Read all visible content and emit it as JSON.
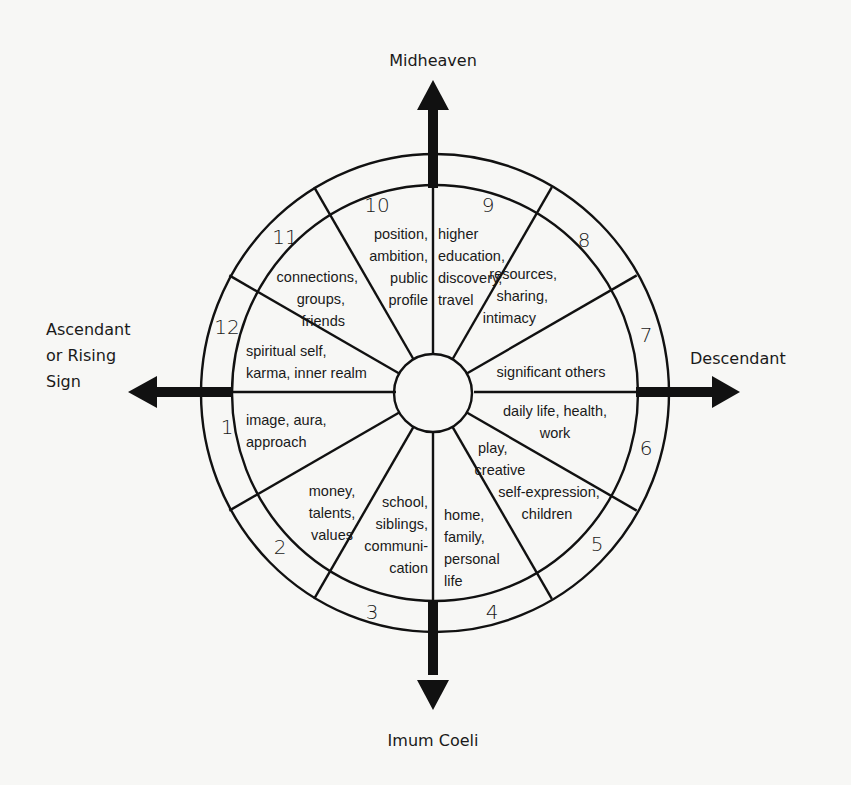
{
  "axes": {
    "top": "Midheaven",
    "bottom": "Imum Coeli",
    "left": [
      "Ascendant",
      "or Rising",
      "Sign"
    ],
    "right": "Descendant"
  },
  "houses": [
    {
      "number": "1",
      "meaning": [
        "image, aura,",
        "approach"
      ]
    },
    {
      "number": "2",
      "meaning": [
        "money,",
        "talents,",
        "values"
      ]
    },
    {
      "number": "3",
      "meaning": [
        "school,",
        "siblings,",
        "communi-",
        "cation"
      ]
    },
    {
      "number": "4",
      "meaning": [
        "home,",
        "family,",
        "personal",
        "life"
      ]
    },
    {
      "number": "5",
      "meaning": [
        "play,",
        "creative",
        "self-expression,",
        "children"
      ]
    },
    {
      "number": "6",
      "meaning": [
        "daily life, health,",
        "work"
      ]
    },
    {
      "number": "7",
      "meaning": [
        "significant others"
      ]
    },
    {
      "number": "8",
      "meaning": [
        "resources,",
        "sharing,",
        "intimacy"
      ]
    },
    {
      "number": "9",
      "meaning": [
        "higher",
        "education,",
        "discovery,",
        "travel"
      ]
    },
    {
      "number": "10",
      "meaning": [
        "position,",
        "ambition,",
        "public",
        "profile"
      ]
    },
    {
      "number": "11",
      "meaning": [
        "connections,",
        "groups,",
        "friends"
      ]
    },
    {
      "number": "12",
      "meaning": [
        "spiritual self,",
        "karma, inner realm"
      ]
    }
  ],
  "colors": {
    "ink": "#111111",
    "background": "#f7f7f5"
  }
}
